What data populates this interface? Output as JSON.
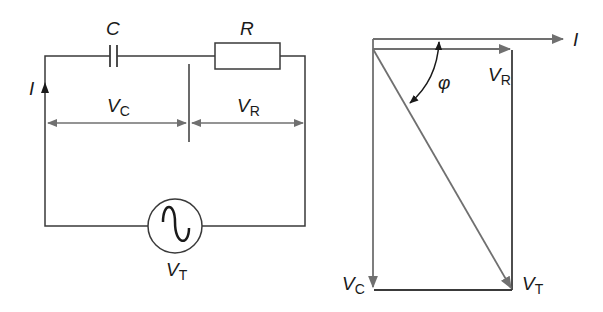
{
  "circuit": {
    "title": "Series RC circuit",
    "components": {
      "capacitor": {
        "label": "C"
      },
      "resistor": {
        "label": "R"
      },
      "source": {
        "label_main": "V",
        "label_sub": "T",
        "type": "AC voltage source"
      }
    },
    "current": {
      "label": "I",
      "direction": "up"
    },
    "voltages": {
      "vc": {
        "main": "V",
        "sub": "C"
      },
      "vr": {
        "main": "V",
        "sub": "R"
      }
    }
  },
  "phasor": {
    "title": "Phasor diagram",
    "current": {
      "label": "I"
    },
    "vr": {
      "main": "V",
      "sub": "R"
    },
    "vc": {
      "main": "V",
      "sub": "C"
    },
    "vt": {
      "main": "V",
      "sub": "T"
    },
    "angle": {
      "label": "φ"
    }
  },
  "colors": {
    "line": "#3a3a3a",
    "arrow": "#707070",
    "text": "#1a1a1a"
  }
}
